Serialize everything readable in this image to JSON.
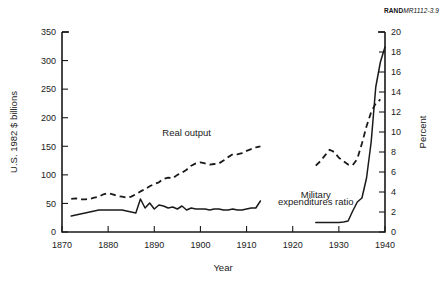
{
  "credit": {
    "brand": "RAND",
    "code": "MR1112-3.9"
  },
  "chart_data": {
    "type": "line",
    "title": "",
    "xlabel": "Year",
    "ylabel": "U.S. 1982 $ billions",
    "y2label": "Percent",
    "xlim": [
      1870,
      1940
    ],
    "ylim": [
      0,
      350
    ],
    "y2lim": [
      0,
      20
    ],
    "xticks": [
      1870,
      1880,
      1890,
      1900,
      1910,
      1920,
      1930,
      1940
    ],
    "yticks": [
      0,
      50,
      100,
      150,
      200,
      250,
      300,
      350
    ],
    "y2ticks": [
      0,
      2,
      4,
      6,
      8,
      10,
      12,
      14,
      16,
      18,
      20
    ],
    "grid": false,
    "legend_position": "inline-annotations",
    "annotations": [
      {
        "text": "Real output",
        "x": 1897,
        "y": 168
      },
      {
        "text": "Military",
        "x": 1925,
        "y": 60
      },
      {
        "text": "expenditures ratio",
        "x": 1925,
        "y": 48
      }
    ],
    "series": [
      {
        "name": "Real output",
        "style": "dashed",
        "axis": "left",
        "units": "U.S. 1982 $ billions",
        "points": [
          [
            1872,
            58
          ],
          [
            1873,
            59
          ],
          [
            1874,
            57
          ],
          [
            1875,
            57
          ],
          [
            1876,
            58
          ],
          [
            1877,
            60
          ],
          [
            1878,
            62
          ],
          [
            1879,
            66
          ],
          [
            1880,
            68
          ],
          [
            1881,
            66
          ],
          [
            1882,
            63
          ],
          [
            1883,
            62
          ],
          [
            1884,
            60
          ],
          [
            1885,
            62
          ],
          [
            1886,
            66
          ],
          [
            1887,
            71
          ],
          [
            1888,
            75
          ],
          [
            1889,
            80
          ],
          [
            1890,
            84
          ],
          [
            1891,
            87
          ],
          [
            1892,
            93
          ],
          [
            1893,
            95
          ],
          [
            1894,
            94
          ],
          [
            1895,
            100
          ],
          [
            1896,
            104
          ],
          [
            1897,
            109
          ],
          [
            1898,
            116
          ],
          [
            1899,
            120
          ],
          [
            1900,
            122
          ],
          [
            1901,
            120
          ],
          [
            1902,
            118
          ],
          [
            1903,
            119
          ],
          [
            1904,
            120
          ],
          [
            1905,
            125
          ],
          [
            1906,
            131
          ],
          [
            1907,
            136
          ],
          [
            1908,
            136
          ],
          [
            1909,
            138
          ],
          [
            1910,
            142
          ],
          [
            1911,
            145
          ],
          [
            1912,
            148
          ],
          [
            1913,
            150
          ],
          [
            1925,
            116
          ],
          [
            1926,
            124
          ],
          [
            1927,
            134
          ],
          [
            1928,
            144
          ],
          [
            1929,
            140
          ],
          [
            1930,
            130
          ],
          [
            1931,
            124
          ],
          [
            1932,
            118
          ],
          [
            1933,
            117
          ],
          [
            1934,
            128
          ],
          [
            1935,
            155
          ],
          [
            1936,
            185
          ],
          [
            1937,
            210
          ],
          [
            1938,
            225
          ],
          [
            1939,
            232
          ]
        ]
      },
      {
        "name": "Military expenditures ratio",
        "style": "solid",
        "axis": "right",
        "units": "Percent",
        "points": [
          [
            1872,
            1.6
          ],
          [
            1873,
            1.7
          ],
          [
            1874,
            1.8
          ],
          [
            1875,
            1.9
          ],
          [
            1876,
            2.0
          ],
          [
            1877,
            2.1
          ],
          [
            1878,
            2.2
          ],
          [
            1879,
            2.2
          ],
          [
            1880,
            2.2
          ],
          [
            1881,
            2.2
          ],
          [
            1882,
            2.2
          ],
          [
            1883,
            2.2
          ],
          [
            1884,
            2.1
          ],
          [
            1885,
            2.0
          ],
          [
            1886,
            1.9
          ],
          [
            1887,
            3.3
          ],
          [
            1888,
            2.4
          ],
          [
            1889,
            2.9
          ],
          [
            1890,
            2.3
          ],
          [
            1891,
            2.7
          ],
          [
            1892,
            2.6
          ],
          [
            1893,
            2.4
          ],
          [
            1894,
            2.5
          ],
          [
            1895,
            2.3
          ],
          [
            1896,
            2.6
          ],
          [
            1897,
            2.2
          ],
          [
            1898,
            2.4
          ],
          [
            1899,
            2.3
          ],
          [
            1900,
            2.3
          ],
          [
            1901,
            2.3
          ],
          [
            1902,
            2.2
          ],
          [
            1903,
            2.3
          ],
          [
            1904,
            2.3
          ],
          [
            1905,
            2.2
          ],
          [
            1906,
            2.2
          ],
          [
            1907,
            2.3
          ],
          [
            1908,
            2.2
          ],
          [
            1909,
            2.2
          ],
          [
            1910,
            2.3
          ],
          [
            1911,
            2.4
          ],
          [
            1912,
            2.4
          ],
          [
            1913,
            3.1
          ],
          [
            1925,
            0.95
          ],
          [
            1926,
            0.95
          ],
          [
            1927,
            0.95
          ],
          [
            1928,
            0.95
          ],
          [
            1929,
            0.95
          ],
          [
            1930,
            0.95
          ],
          [
            1931,
            1.0
          ],
          [
            1932,
            1.1
          ],
          [
            1933,
            2.1
          ],
          [
            1934,
            3.0
          ],
          [
            1935,
            3.4
          ],
          [
            1936,
            5.4
          ],
          [
            1937,
            9.0
          ],
          [
            1938,
            14.5
          ],
          [
            1939,
            17.0
          ],
          [
            1940,
            18.5
          ]
        ]
      }
    ]
  }
}
